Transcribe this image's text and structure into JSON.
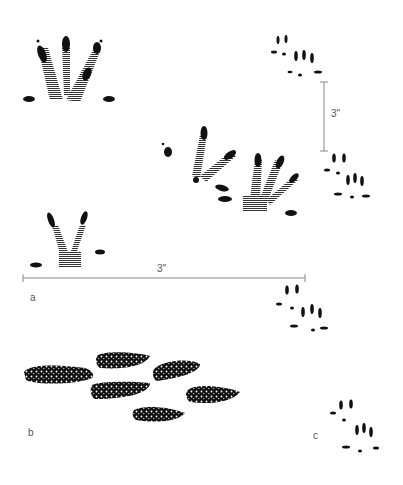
{
  "figure": {
    "panels": [
      {
        "id": "a",
        "label": "a",
        "subject": "footprints (large hind and fore feet, hatched)"
      },
      {
        "id": "b",
        "label": "b",
        "subject": "droppings (six pellets, stippled)"
      },
      {
        "id": "c",
        "label": "c",
        "subject": "small footprints (track sequence, right column)"
      }
    ],
    "scale_bars": [
      {
        "orientation": "horizontal",
        "label": "3\""
      },
      {
        "orientation": "vertical",
        "label": "3\""
      }
    ],
    "colors": {
      "ink": "#111111",
      "scale": "#888888",
      "hatch": "#333333",
      "background": "#ffffff"
    }
  }
}
